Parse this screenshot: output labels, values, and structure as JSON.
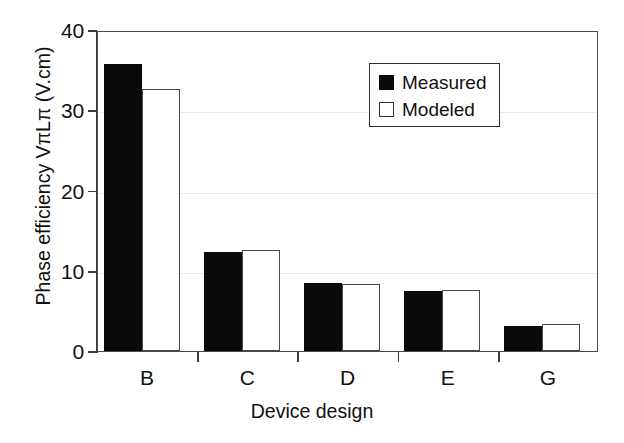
{
  "chart_data": {
    "type": "bar",
    "title": "",
    "xlabel": "Device design",
    "ylabel": "Phase efficiency VπLπ (V.cm)",
    "categories": [
      "B",
      "C",
      "D",
      "E",
      "G"
    ],
    "series": [
      {
        "name": "Measured",
        "color": "#0a0a0a",
        "fill": "solid",
        "values": [
          35.8,
          12.3,
          8.5,
          7.5,
          3.1
        ]
      },
      {
        "name": "Modeled",
        "color": "#ffffff",
        "fill": "open",
        "values": [
          32.7,
          12.6,
          8.4,
          7.6,
          3.4
        ]
      }
    ],
    "ylim": [
      0,
      40
    ],
    "yticks": [
      0,
      10,
      20,
      30,
      40
    ],
    "ytick_labels": [
      "0",
      "10",
      "20",
      "30",
      "40"
    ],
    "grid": "horizontal-faint",
    "legend_position": "upper-right-inside"
  },
  "legend": {
    "entries": [
      {
        "label": "Measured",
        "style": "filled"
      },
      {
        "label": "Modeled",
        "style": "open"
      }
    ]
  }
}
